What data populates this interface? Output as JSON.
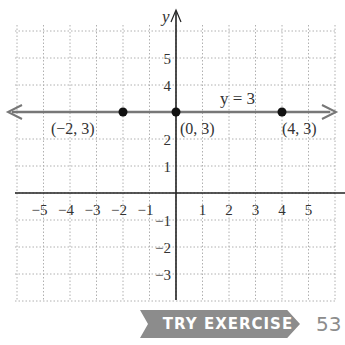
{
  "chart_data": {
    "type": "line",
    "title": "",
    "xlabel": "",
    "ylabel": "y",
    "xlim": [
      -6,
      6
    ],
    "ylim": [
      -4,
      6
    ],
    "grid": true,
    "x_ticks": [
      "-5",
      "-4",
      "-3",
      "-2",
      "-1",
      "1",
      "2",
      "3",
      "4",
      "5"
    ],
    "y_ticks": [
      "5",
      "4",
      "2",
      "1",
      "-1",
      "-2",
      "-3"
    ],
    "series": [
      {
        "name": "y = 3",
        "equation": "y = 3",
        "line": {
          "x": [
            -6,
            6
          ],
          "y": [
            3,
            3
          ]
        },
        "points": [
          {
            "x": -2,
            "y": 3,
            "label": "(−2, 3)"
          },
          {
            "x": 0,
            "y": 3,
            "label": "(0, 3)"
          },
          {
            "x": 4,
            "y": 3,
            "label": "(4, 3)"
          }
        ]
      }
    ],
    "annotations": [
      "y = 3"
    ]
  },
  "footer": {
    "button_label": "TRY EXERCISE",
    "exercise_number": "53"
  },
  "colors": {
    "line": "#777777",
    "axis": "#222222",
    "grid": "#b0b0b0",
    "point": "#111111",
    "button": "#8c8c8c"
  }
}
